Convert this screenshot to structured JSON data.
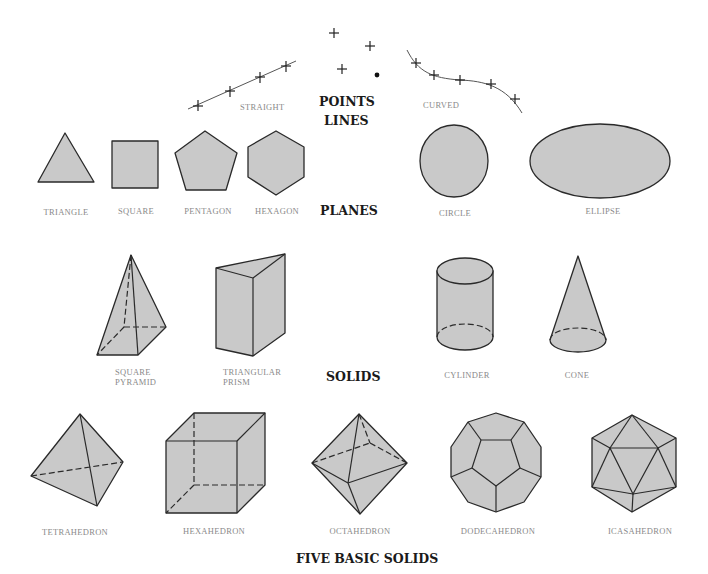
{
  "headings": {
    "points": "POINTS",
    "lines": "LINES",
    "planes": "PLANES",
    "solids": "SOLIDS",
    "five_basic_solids": "FIVE BASIC SOLIDS"
  },
  "lines": {
    "straight": "STRAIGHT",
    "curved": "CURVED"
  },
  "planes": [
    {
      "id": "triangle",
      "label": "TRIANGLE"
    },
    {
      "id": "square",
      "label": "SQUARE"
    },
    {
      "id": "pentagon",
      "label": "PENTAGON"
    },
    {
      "id": "hexagon",
      "label": "HEXAGON"
    },
    {
      "id": "circle",
      "label": "CIRCLE"
    },
    {
      "id": "ellipse",
      "label": "ELLIPSE"
    }
  ],
  "solids": [
    {
      "id": "square-pyramid",
      "label_line1": "SQUARE",
      "label_line2": "PYRAMID"
    },
    {
      "id": "triangular-prism",
      "label_line1": "TRIANGULAR",
      "label_line2": "PRISM"
    },
    {
      "id": "cylinder",
      "label": "CYLINDER"
    },
    {
      "id": "cone",
      "label": "CONE"
    }
  ],
  "basic_solids": [
    {
      "id": "tetrahedron",
      "label": "TETRAHEDRON"
    },
    {
      "id": "hexahedron",
      "label": "HEXAHEDRON"
    },
    {
      "id": "octahedron",
      "label": "OCTAHEDRON"
    },
    {
      "id": "dodecahedron",
      "label": "DODECAHEDRON"
    },
    {
      "id": "icosahedron",
      "label": "ICASAHEDRON"
    }
  ],
  "colors": {
    "fill": "#c9c9c9",
    "stroke": "#2a2a2a",
    "label": "#8a8a8a",
    "heading": "#1a1a1a"
  }
}
